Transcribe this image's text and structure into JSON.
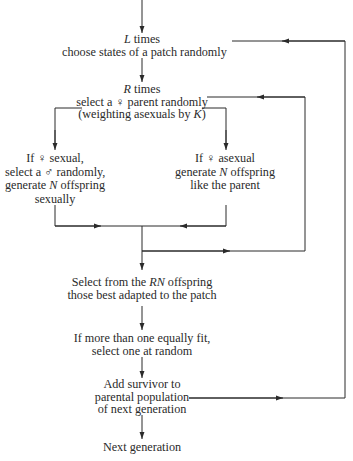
{
  "nodes": {
    "l_loop": {
      "line1_var": "L",
      "line1_rest": " times",
      "line2": "choose states of a patch randomly"
    },
    "r_loop": {
      "line1_var": "R",
      "line1_rest": " times",
      "line2": "select a ♀ parent randomly",
      "line3_pre": "(weighting asexuals by ",
      "line3_var": "K",
      "line3_post": ")"
    },
    "sexual": {
      "line1": "If ♀ sexual,",
      "line2": "select a ♂ randomly,",
      "line3_pre": "generate ",
      "line3_var": "N",
      "line3_post": " offspring",
      "line4": "sexually"
    },
    "asexual": {
      "line1": "If ♀ asexual",
      "line2_pre": "generate ",
      "line2_var": "N",
      "line2_post": " offspring",
      "line3": "like the parent"
    },
    "select_best": {
      "line1_pre": "Select from the ",
      "line1_var": "RN",
      "line1_post": " offspring",
      "line2": "those best adapted to the patch"
    },
    "tie_break": {
      "line1": "If more than one equally fit,",
      "line2": "select one at random"
    },
    "add_survivor": {
      "line1": "Add survivor to",
      "line2": "parental population",
      "line3": "of next generation"
    },
    "next_gen": {
      "line1": "Next generation"
    }
  },
  "colors": {
    "line": "#2a2a2a",
    "text": "#2a2a2a",
    "background": "#ffffff"
  }
}
